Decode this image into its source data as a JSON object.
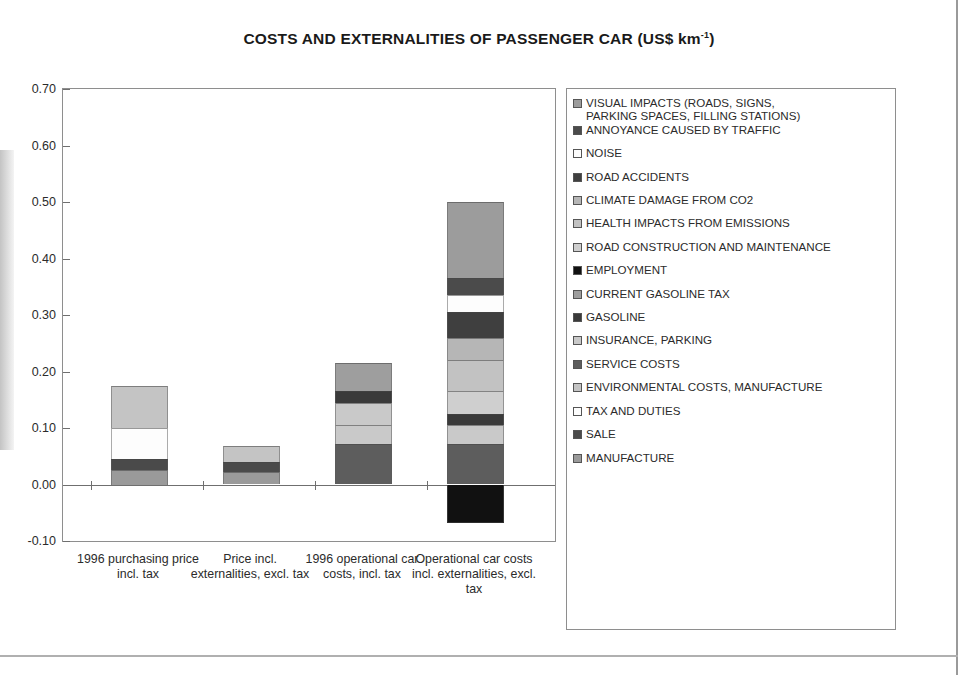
{
  "chart_data": {
    "type": "bar",
    "title": "COSTS AND EXTERNALITIES OF PASSENGER CAR (US$ km-1)",
    "title_main": "COSTS AND EXTERNALITIES OF PASSENGER CAR (US$ km",
    "title_sup": "-1",
    "title_tail": ")",
    "xlabel": "",
    "ylabel": "",
    "ylim": [
      -0.1,
      0.7
    ],
    "yticks": [
      "0.70",
      "0.60",
      "0.50",
      "0.40",
      "0.30",
      "0.20",
      "0.10",
      "0.00",
      "-0.10"
    ],
    "ytick_values": [
      0.7,
      0.6,
      0.5,
      0.4,
      0.3,
      0.2,
      0.1,
      0.0,
      -0.1
    ],
    "grid": false,
    "stacked": true,
    "legend_position": "right",
    "categories": [
      "1996 purchasing price incl. tax",
      "Price incl. externalities, excl. tax",
      "1996 operational car costs, incl. tax",
      "Operational car costs incl. externalities, excl. tax"
    ],
    "series": [
      {
        "name": "MANUFACTURE",
        "color": "#9a9a9a",
        "values": [
          0.025,
          0.022,
          0.0,
          0.0
        ]
      },
      {
        "name": "SALE",
        "color": "#4a4a4a",
        "values": [
          0.02,
          0.017,
          0.0,
          0.0
        ]
      },
      {
        "name": "TAX AND DUTIES",
        "color": "#fdfdfd",
        "values": [
          0.055,
          0.0,
          0.0,
          0.0
        ]
      },
      {
        "name": "ENVIRONMENTAL COSTS, MANUFACTURE",
        "color": "#c4c4c4",
        "values": [
          0.075,
          0.029,
          0.0,
          0.0
        ]
      },
      {
        "name": "SERVICE COSTS",
        "color": "#5d5d5d",
        "values": [
          0.0,
          0.0,
          0.072,
          0.072
        ]
      },
      {
        "name": "INSURANCE, PARKING",
        "color": "#c9c9c9",
        "values": [
          0.0,
          0.0,
          0.033,
          0.033
        ]
      },
      {
        "name": "GASOLINE",
        "color": "#3a3a3a",
        "values": [
          0.0,
          0.0,
          0.02,
          0.02
        ]
      },
      {
        "name": "CURRENT GASOLINE TAX",
        "color": "#9e9e9e",
        "values": [
          0.0,
          0.0,
          0.05,
          0.0
        ]
      },
      {
        "name": "EMPLOYMENT",
        "color": "#111111",
        "values": [
          0.0,
          0.0,
          0.0,
          -0.068
        ]
      },
      {
        "name": "ROAD CONSTRUCTION AND MAINTENANCE",
        "color": "#cfcfcf",
        "values": [
          0.0,
          0.0,
          0.0,
          0.04
        ]
      },
      {
        "name": "HEALTH IMPACTS FROM EMISSIONS",
        "color": "#c2c2c2",
        "values": [
          0.0,
          0.0,
          0.0,
          0.055
        ]
      },
      {
        "name": "CLIMATE DAMAGE FROM CO2",
        "color": "#b6b6b6",
        "values": [
          0.0,
          0.0,
          0.0,
          0.04
        ]
      },
      {
        "name": "ROAD ACCIDENTS",
        "color": "#3f3f3f",
        "values": [
          0.0,
          0.0,
          0.0,
          0.045
        ]
      },
      {
        "name": "NOISE",
        "color": "#fdfdfd",
        "values": [
          0.0,
          0.0,
          0.0,
          0.03
        ]
      },
      {
        "name": "ANNOYANCE CAUSED BY TRAFFIC",
        "color": "#4b4b4b",
        "values": [
          0.0,
          0.0,
          0.0,
          0.03
        ]
      },
      {
        "name": "VISUAL IMPACTS (ROADS, SIGNS, PARKING SPACES, FILLING STATIONS)",
        "color": "#9c9c9c",
        "values": [
          0.0,
          0.0,
          0.0,
          0.135
        ]
      }
    ],
    "bar_totals_positive": [
      0.175,
      0.068,
      0.215,
      0.6
    ],
    "bar_totals_negative": [
      0.0,
      0.0,
      0.0,
      -0.068
    ],
    "stack_order_bottom_to_top": {
      "bar1": [
        "MANUFACTURE",
        "SALE",
        "TAX AND DUTIES",
        "ENVIRONMENTAL COSTS, MANUFACTURE"
      ],
      "bar2": [
        "MANUFACTURE",
        "SALE",
        "ENVIRONMENTAL COSTS, MANUFACTURE"
      ],
      "bar3": [
        "SERVICE COSTS",
        "INSURANCE, PARKING",
        "INSURANCE, PARKING",
        "GASOLINE",
        "CURRENT GASOLINE TAX"
      ],
      "bar4": [
        "EMPLOYMENT (negative)",
        "SERVICE COSTS",
        "INSURANCE, PARKING",
        "GASOLINE",
        "ROAD CONSTRUCTION AND MAINTENANCE",
        "HEALTH IMPACTS FROM EMISSIONS",
        "CLIMATE DAMAGE FROM CO2",
        "ROAD ACCIDENTS",
        "NOISE",
        "ANNOYANCE CAUSED BY TRAFFIC",
        "VISUAL IMPACTS"
      ]
    }
  },
  "legend": {
    "items": [
      {
        "label": "VISUAL IMPACTS (ROADS, SIGNS,\nPARKING SPACES, FILLING STATIONS)",
        "color": "#9c9c9c"
      },
      {
        "label": "ANNOYANCE CAUSED BY TRAFFIC",
        "color": "#4b4b4b"
      },
      {
        "label": "NOISE",
        "color": "#fdfdfd"
      },
      {
        "label": "ROAD ACCIDENTS",
        "color": "#3f3f3f"
      },
      {
        "label": "CLIMATE DAMAGE FROM CO2",
        "color": "#b6b6b6"
      },
      {
        "label": "HEALTH IMPACTS FROM EMISSIONS",
        "color": "#c2c2c2"
      },
      {
        "label": "ROAD CONSTRUCTION AND MAINTENANCE",
        "color": "#cfcfcf"
      },
      {
        "label": "EMPLOYMENT",
        "color": "#111111"
      },
      {
        "label": "CURRENT GASOLINE TAX",
        "color": "#9e9e9e"
      },
      {
        "label": "GASOLINE",
        "color": "#3a3a3a"
      },
      {
        "label": "INSURANCE, PARKING",
        "color": "#c9c9c9"
      },
      {
        "label": "SERVICE COSTS",
        "color": "#5d5d5d"
      },
      {
        "label": "ENVIRONMENTAL COSTS, MANUFACTURE",
        "color": "#c4c4c4"
      },
      {
        "label": "TAX AND DUTIES",
        "color": "#fdfdfd"
      },
      {
        "label": "SALE",
        "color": "#4b4b4b"
      },
      {
        "label": "MANUFACTURE",
        "color": "#9a9a9a"
      }
    ]
  }
}
